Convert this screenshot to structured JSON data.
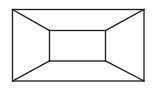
{
  "diagram": {
    "type": "line-drawing",
    "stroke_color": "#1a1a1a",
    "background": "#ffffff",
    "outer_rect": {
      "x1": 12,
      "y1": 9,
      "x2": 144,
      "y2": 81
    },
    "inner_rect": {
      "x1": 49,
      "y1": 30,
      "x2": 105,
      "y2": 61
    }
  }
}
